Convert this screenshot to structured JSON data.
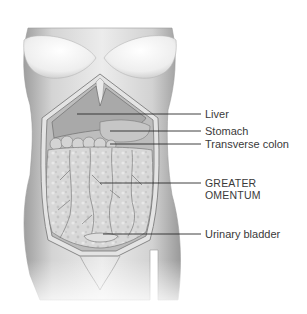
{
  "figure": {
    "labels": [
      {
        "id": "liver",
        "text": "Liver",
        "line_y": 114,
        "line_x1": 77,
        "line_x2": 201,
        "text_x": 205,
        "text_y": 108
      },
      {
        "id": "stomach",
        "text": "Stomach",
        "line_y": 131,
        "line_x1": 110,
        "line_x2": 201,
        "text_x": 205,
        "text_y": 125
      },
      {
        "id": "transverse-colon",
        "text": "Transverse colon",
        "line_y": 144,
        "line_x1": 110,
        "line_x2": 201,
        "text_x": 205,
        "text_y": 138
      },
      {
        "id": "greater-omentum",
        "text": "GREATER",
        "text2": "OMENTUM",
        "line_y": 183,
        "line_x1": 100,
        "line_x2": 201,
        "text_x": 205,
        "text_y": 177
      },
      {
        "id": "urinary-bladder",
        "text": "Urinary bladder",
        "line_y": 234,
        "line_x1": 103,
        "line_x2": 201,
        "text_x": 205,
        "text_y": 228
      }
    ],
    "colors": {
      "skin_light": "#efefef",
      "skin_mid": "#cfcfcf",
      "skin_dark": "#9a9a9a",
      "organ": "#bdbdbd",
      "omentum": "#d6d6d6",
      "vessel": "#6a6a6a",
      "leader_line": "#2a2a2a",
      "text": "#3a3a3a"
    }
  }
}
